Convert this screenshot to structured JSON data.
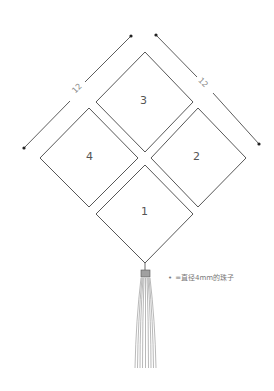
{
  "diagram": {
    "squares": [
      {
        "id": "3",
        "label": "3"
      },
      {
        "id": "4",
        "label": "4"
      },
      {
        "id": "2",
        "label": "2"
      },
      {
        "id": "1",
        "label": "1"
      }
    ],
    "dimensions": [
      {
        "side": "left",
        "value": "12"
      },
      {
        "side": "right",
        "value": "12"
      }
    ],
    "legend": {
      "marker": "•",
      "text": "=直径4mm的珠子"
    },
    "colors": {
      "stroke": "#444444",
      "dimension": "#333333",
      "text": "#555555",
      "bead": "#9a9a9a",
      "tassel": "#8a8a8a"
    }
  }
}
